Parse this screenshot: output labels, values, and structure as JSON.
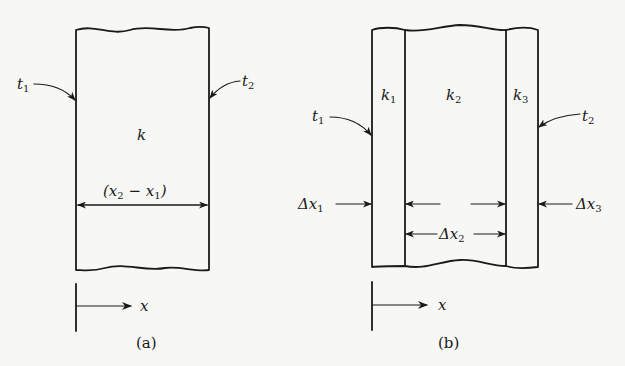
{
  "figure_a": {
    "caption": "(a)",
    "temp_left": {
      "base": "t",
      "sub": "1"
    },
    "temp_right": {
      "base": "t",
      "sub": "2"
    },
    "conductivity": "k",
    "thickness_label": {
      "open": "(",
      "a": "x",
      "a_sub": "2",
      "minus": " − ",
      "b": "x",
      "b_sub": "1",
      "close": ")"
    },
    "axis_label": "x"
  },
  "figure_b": {
    "caption": "(b)",
    "temp_left": {
      "base": "t",
      "sub": "1"
    },
    "temp_right": {
      "base": "t",
      "sub": "2"
    },
    "layers": [
      {
        "base": "k",
        "sub": "1"
      },
      {
        "base": "k",
        "sub": "2"
      },
      {
        "base": "k",
        "sub": "3"
      }
    ],
    "dx1": {
      "delta": "Δ",
      "base": "x",
      "sub": "1"
    },
    "dx2": {
      "delta": "Δ",
      "base": "x",
      "sub": "2"
    },
    "dx3": {
      "delta": "Δ",
      "base": "x",
      "sub": "3"
    },
    "axis_label": "x"
  },
  "colors": {
    "ink": "#1a1a1a",
    "paper": "#f7f7f5"
  }
}
